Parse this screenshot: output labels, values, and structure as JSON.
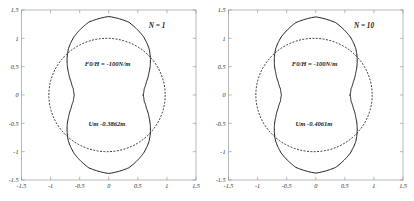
{
  "figure": {
    "background": "#ffffff",
    "line_color": "#111111",
    "frame_color": "#9a9a9a"
  },
  "chart_data": [
    {
      "type": "line",
      "title": "",
      "xlabel": "",
      "ylabel": "",
      "xlim": [
        -1.5,
        1.5
      ],
      "ylim": [
        -1.5,
        1.5
      ],
      "grid": false,
      "legend": "none",
      "xticks": [
        "-1.5",
        "-1",
        "-0.5",
        "0",
        "0.5",
        "1",
        "1.5"
      ],
      "xtick_values": [
        -1.5,
        -1,
        -0.5,
        0,
        0.5,
        1,
        1.5
      ],
      "yticks": [
        "1.5",
        "1",
        "0.5",
        "0",
        "-0.5",
        "-1",
        "-1.5"
      ],
      "ytick_values": [
        1.5,
        1,
        0.5,
        0,
        -0.5,
        -1,
        -1.5
      ],
      "annotations": {
        "case": "N = 1",
        "force": "F0/H = -100N/m",
        "displacement": "Um -0.3862m"
      },
      "series": [
        {
          "name": "deformed-shape",
          "style": "solid",
          "radii_by_angle_deg": [
            {
              "angle": 90,
              "r": 1.385
            },
            {
              "angle": 75,
              "r": 1.33
            },
            {
              "angle": 60,
              "r": 1.19
            },
            {
              "angle": 50,
              "r": 1.075
            },
            {
              "angle": 40,
              "r": 0.935
            },
            {
              "angle": 30,
              "r": 0.8
            },
            {
              "angle": 20,
              "r": 0.69
            },
            {
              "angle": 10,
              "r": 0.618
            },
            {
              "angle": 0,
              "r": 0.592
            },
            {
              "angle": -10,
              "r": 0.618
            },
            {
              "angle": -20,
              "r": 0.69
            },
            {
              "angle": -30,
              "r": 0.8
            },
            {
              "angle": -40,
              "r": 0.935
            },
            {
              "angle": -50,
              "r": 1.075
            },
            {
              "angle": -60,
              "r": 1.19
            },
            {
              "angle": -75,
              "r": 1.33
            },
            {
              "angle": -90,
              "r": 1.385
            }
          ]
        },
        {
          "name": "reference-circle",
          "style": "dashed",
          "radius": 1.0,
          "center": [
            -0.03,
            0.0
          ]
        }
      ]
    },
    {
      "type": "line",
      "title": "",
      "xlabel": "",
      "ylabel": "",
      "xlim": [
        -1.5,
        1.5
      ],
      "ylim": [
        -1.5,
        1.5
      ],
      "grid": false,
      "legend": "none",
      "xticks": [
        "-1.5",
        "-1",
        "-0.5",
        "0",
        "0.5",
        "1",
        "1.5"
      ],
      "xtick_values": [
        -1.5,
        -1,
        -0.5,
        0,
        0.5,
        1,
        1.5
      ],
      "yticks": [
        "1.5",
        "1",
        "0.5",
        "0",
        "-0.5",
        "-1",
        "-1.5"
      ],
      "ytick_values": [
        1.5,
        1,
        0.5,
        0,
        -0.5,
        -1,
        -1.5
      ],
      "annotations": {
        "case": "N = 10",
        "force": "F0/H = -100N/m",
        "displacement": "Um -0.4061m"
      },
      "series": [
        {
          "name": "deformed-shape",
          "style": "solid",
          "radii_by_angle_deg": [
            {
              "angle": 90,
              "r": 1.378
            },
            {
              "angle": 75,
              "r": 1.322
            },
            {
              "angle": 60,
              "r": 1.185
            },
            {
              "angle": 50,
              "r": 1.07
            },
            {
              "angle": 40,
              "r": 0.93
            },
            {
              "angle": 30,
              "r": 0.795
            },
            {
              "angle": 20,
              "r": 0.688
            },
            {
              "angle": 10,
              "r": 0.615
            },
            {
              "angle": 0,
              "r": 0.59
            },
            {
              "angle": -10,
              "r": 0.615
            },
            {
              "angle": -20,
              "r": 0.688
            },
            {
              "angle": -30,
              "r": 0.795
            },
            {
              "angle": -40,
              "r": 0.93
            },
            {
              "angle": -50,
              "r": 1.07
            },
            {
              "angle": -60,
              "r": 1.185
            },
            {
              "angle": -75,
              "r": 1.322
            },
            {
              "angle": -90,
              "r": 1.378
            }
          ]
        },
        {
          "name": "reference-circle",
          "style": "dashed",
          "radius": 1.0,
          "center": [
            -0.03,
            0.0
          ]
        }
      ]
    }
  ]
}
